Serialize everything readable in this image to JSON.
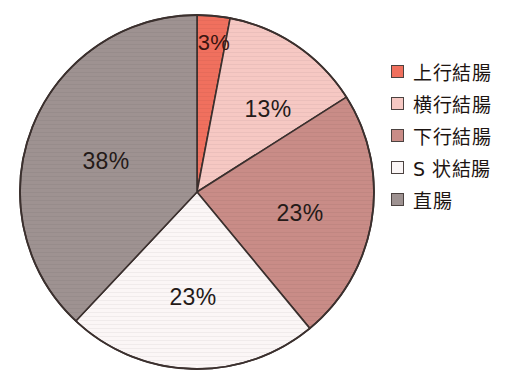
{
  "chart_data": {
    "type": "pie",
    "title": "",
    "subtitle": "",
    "xlabel": "",
    "ylabel": "",
    "grid": false,
    "legend_position": "right",
    "units": "percent",
    "start_angle_deg": 0,
    "direction": "clockwise",
    "center": {
      "x": 197,
      "y": 192
    },
    "radius": 177,
    "categories": [
      "上行結腸",
      "横行結腸",
      "下行結腸",
      "S 状結腸",
      "直腸"
    ],
    "values": [
      3,
      13,
      23,
      23,
      38
    ],
    "labels": [
      "3%",
      "13%",
      "23%",
      "23%",
      "38%"
    ],
    "colors": [
      "#F0705E",
      "#F6C8C3",
      "#C98C87",
      "#FBF6F6",
      "#9E9291"
    ],
    "slices": [
      {
        "name": "上行結腸",
        "value": 3,
        "label": "3%",
        "color": "#F0705E",
        "start_deg": 0,
        "end_deg": 10.8,
        "label_x": 214,
        "label_y": 43
      },
      {
        "name": "横行結腸",
        "value": 13,
        "label": "13%",
        "color": "#F6C8C3",
        "start_deg": 10.8,
        "end_deg": 57.6,
        "label_x": 268,
        "label_y": 109
      },
      {
        "name": "下行結腸",
        "value": 23,
        "label": "23%",
        "color": "#C98C87",
        "start_deg": 57.6,
        "end_deg": 140.4,
        "label_x": 300,
        "label_y": 213
      },
      {
        "name": "S 状結腸",
        "value": 23,
        "label": "23%",
        "color": "#FBF6F6",
        "start_deg": 140.4,
        "end_deg": 223.2,
        "label_x": 193,
        "label_y": 297
      },
      {
        "name": "直腸",
        "value": 38,
        "label": "38%",
        "color": "#9E9291",
        "start_deg": 223.2,
        "end_deg": 360,
        "label_x": 106,
        "label_y": 161
      }
    ]
  },
  "legend": {
    "items": [
      {
        "label": "上行結腸",
        "color": "#F0705E"
      },
      {
        "label": "横行結腸",
        "color": "#F6C8C3"
      },
      {
        "label": "下行結腸",
        "color": "#C98C87"
      },
      {
        "label": "S 状結腸",
        "color": "#FBF6F6"
      },
      {
        "label": "直腸",
        "color": "#9E9291"
      }
    ]
  },
  "style": {
    "background": "#FFFFFF",
    "outline": "#3B302E",
    "label_color": "#241A18"
  }
}
